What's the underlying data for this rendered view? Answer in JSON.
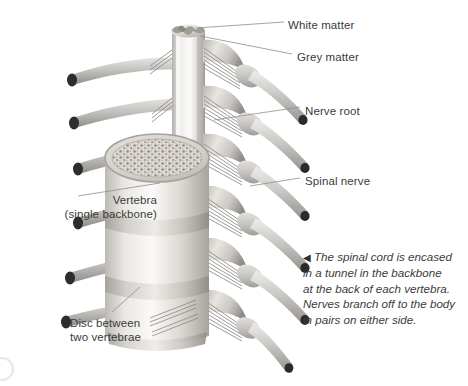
{
  "figure": {
    "background_color": "#ffffff",
    "ink_color": "#3b3b3b",
    "leader_line_color": "#9a9a9a",
    "bone_light": "#f4f2ef",
    "bone_mid": "#d8d5d0",
    "bone_shadow": "#9b9893",
    "nerve_light": "#e2e0dd",
    "nerve_mid": "#b9b7b3",
    "nerve_dark": "#6f6d6a",
    "nerve_tip": "#2b2a29",
    "cord_light": "#f1efec",
    "cord_mid": "#cfccc7",
    "grey_matter_color": "#a9a6a1"
  },
  "labels": [
    {
      "id": "white-matter",
      "text": "White matter",
      "x": 288,
      "y": 18,
      "align": "left"
    },
    {
      "id": "grey-matter",
      "text": "Grey matter",
      "x": 297,
      "y": 50,
      "align": "left"
    },
    {
      "id": "nerve-root",
      "text": "Nerve root",
      "x": 305,
      "y": 104,
      "align": "left"
    },
    {
      "id": "spinal-nerve",
      "text": "Spinal nerve",
      "x": 305,
      "y": 174,
      "align": "left"
    },
    {
      "id": "vertebra",
      "text": "Vertebra",
      "x": 37,
      "y": 193,
      "align": "right",
      "width": 120
    },
    {
      "id": "vertebra-sub",
      "text": "(single backbone)",
      "x": 10,
      "y": 207,
      "align": "right",
      "width": 147
    },
    {
      "id": "disc-1",
      "text": "Disc between",
      "x": 70,
      "y": 316,
      "align": "left"
    },
    {
      "id": "disc-2",
      "text": "two vertebrae",
      "x": 70,
      "y": 330,
      "align": "left"
    }
  ],
  "caption": {
    "marker": "◀",
    "lines": [
      "The spinal cord is encased",
      "in a tunnel in the backbone",
      "at the back of each vertebra.",
      "Nerves branch off to the body",
      "in pairs on either side."
    ]
  },
  "anatomy": {
    "vertebra_count": 3,
    "disc_count": 3,
    "left_nerve_count": 6,
    "right_nerve_count": 6,
    "cord_segments": [
      "white matter",
      "grey matter"
    ]
  }
}
